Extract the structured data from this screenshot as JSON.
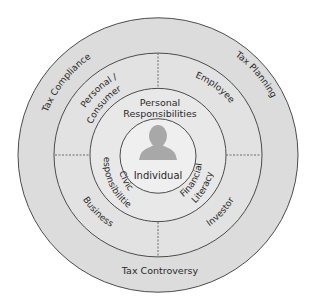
{
  "diagram": {
    "type": "concentric-rings",
    "colors": {
      "outer_ring": "#dcdcdc",
      "middle_ring": "#e2e2e2",
      "inner_ring": "#e8e8e8",
      "core": "#efefef",
      "stroke": "#4a4a4a",
      "divider": "#6a6a6a",
      "icon": "#a8a8a8"
    },
    "outer_ring": {
      "labels": {
        "top_left": "Tax Compliance",
        "top_right": "Tax Planning",
        "bottom": "Tax Controversy"
      }
    },
    "middle_ring": {
      "labels": {
        "top_left": "Personal /",
        "top_left_2": "Consumer",
        "top_right": "Employee",
        "bottom_left": "Business",
        "bottom_right": "Investor"
      }
    },
    "inner_ring": {
      "labels": {
        "top_1": "Personal",
        "top_2": "Responsibilities",
        "left_1": "Civic",
        "left_2": "Responsibilities",
        "right_1": "Financial",
        "right_2": "Literacy"
      }
    },
    "core": {
      "icon": "person-silhouette-icon",
      "label": "Individual"
    }
  }
}
